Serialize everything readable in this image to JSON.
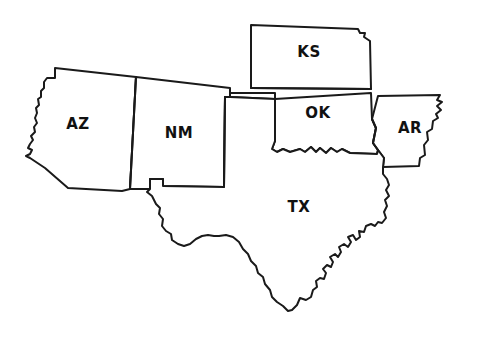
{
  "map": {
    "title": "South Central United States outline map",
    "style": {
      "background_color": "#ffffff",
      "fill_color": "#ffffff",
      "outline_color": "#1a1a1a",
      "label_color": "#111111"
    },
    "states": [
      {
        "id": "az",
        "code": "AZ",
        "name": "Arizona",
        "label_x": 78,
        "label_y": 124
      },
      {
        "id": "nm",
        "code": "NM",
        "name": "New Mexico",
        "label_x": 179,
        "label_y": 133
      },
      {
        "id": "ks",
        "code": "KS",
        "name": "Kansas",
        "label_x": 309,
        "label_y": 52
      },
      {
        "id": "ok",
        "code": "OK",
        "name": "Oklahoma",
        "label_x": 318,
        "label_y": 113
      },
      {
        "id": "ar",
        "code": "AR",
        "name": "Arkansas",
        "label_x": 410,
        "label_y": 128
      },
      {
        "id": "tx",
        "code": "TX",
        "name": "Texas",
        "label_x": 299,
        "label_y": 207
      }
    ]
  }
}
